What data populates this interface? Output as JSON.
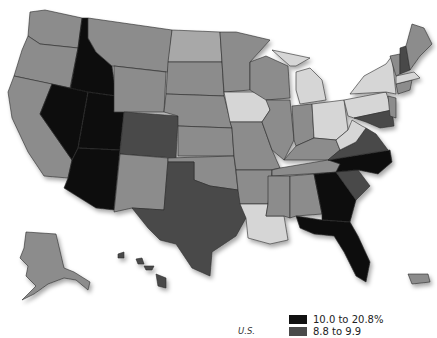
{
  "map": {
    "region": "United States",
    "label": "U.S.",
    "shade_colors": {
      "black": "#111111",
      "dark": "#4a4a4a",
      "medium": "#8c8c8c",
      "light": "#d6d6d6"
    }
  },
  "legend": {
    "items": [
      {
        "label": "10.0 to 20.8%",
        "color": "#111111"
      },
      {
        "label": "8.8 to 9.9",
        "color": "#4a4a4a"
      }
    ]
  }
}
